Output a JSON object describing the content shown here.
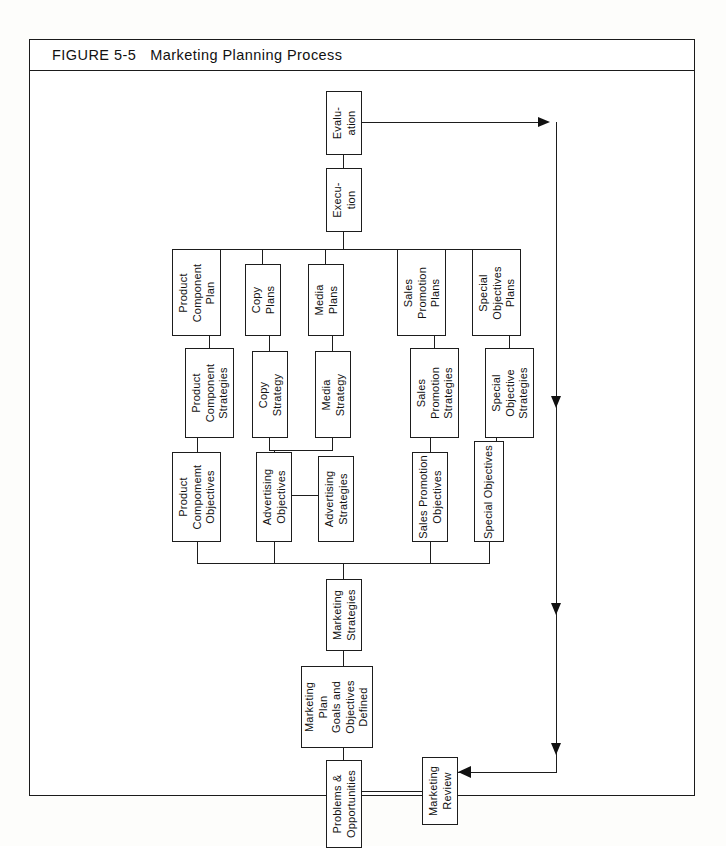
{
  "figure": {
    "number": "FIGURE 5-5",
    "title": "Marketing Planning Process"
  },
  "nodes": {
    "evaluation": {
      "lines": [
        "Evalu-",
        "ation"
      ]
    },
    "execution": {
      "lines": [
        "Execu-",
        "tion"
      ]
    },
    "product_component_plan": {
      "lines": [
        "Product",
        "Component",
        "Plan"
      ]
    },
    "copy_plans": {
      "lines": [
        "Copy",
        "Plans"
      ]
    },
    "media_plans": {
      "lines": [
        "Media",
        "Plans"
      ]
    },
    "sales_promotion_plans": {
      "lines": [
        "Sales",
        "Promotion",
        "Plans"
      ]
    },
    "special_objectives_plans": {
      "lines": [
        "Special",
        "Objectives",
        "Plans"
      ]
    },
    "product_component_strategies": {
      "lines": [
        "Product",
        "Component",
        "Strategies"
      ]
    },
    "copy_strategy": {
      "lines": [
        "Copy",
        "Strategy"
      ]
    },
    "media_strategy": {
      "lines": [
        "Media",
        "Strategy"
      ]
    },
    "sales_promotion_strategies": {
      "lines": [
        "Sales",
        "Promotion",
        "Strategies"
      ]
    },
    "special_objective_strategies": {
      "lines": [
        "Special",
        "Objective",
        "Strategies"
      ]
    },
    "product_component_objectives": {
      "lines": [
        "Product",
        "Compomemt",
        "Objectives"
      ]
    },
    "advertising_objectives": {
      "lines": [
        "Advertising",
        "Objectives"
      ]
    },
    "advertising_strategies": {
      "lines": [
        "Advertising",
        "Strategies"
      ]
    },
    "sales_promotion_objectives": {
      "lines": [
        "Sales Promotion",
        "Objectives"
      ]
    },
    "special_objectives": {
      "lines": [
        "Special Objectives"
      ]
    },
    "marketing_strategies": {
      "lines": [
        "Marketing",
        "Strategies"
      ]
    },
    "marketing_plan_goals": {
      "lines": [
        "Marketing",
        "Plan",
        "Goals and",
        "Objectives",
        "Defined"
      ]
    },
    "problems_opportunities": {
      "lines": [
        "Problems &",
        "Opportunities"
      ]
    },
    "marketing_review": {
      "lines": [
        "Marketing",
        "Review"
      ]
    }
  },
  "colors": {
    "ink": "#1d1d1d",
    "paper": "#ffffff",
    "page": "#fdfdfb"
  }
}
